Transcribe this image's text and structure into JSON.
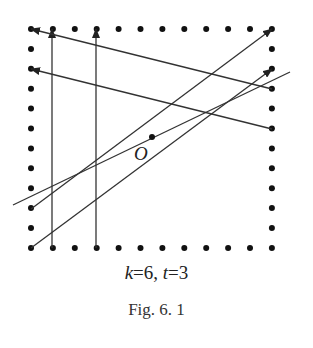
{
  "figure": {
    "caption_params": {
      "k_label": "k",
      "k_value": "=6, ",
      "t_label": "t",
      "t_value": "=3"
    },
    "figure_label": "Fig. 6. 1",
    "point_label": "O"
  },
  "diagram": {
    "grid": {
      "columns": 12,
      "rows": 12,
      "x0": 31,
      "x_step": 21.9,
      "y0": 29,
      "y_step": 19.9,
      "border_only": true
    },
    "center_point": {
      "x": 152,
      "y": 137,
      "label": "O"
    },
    "arrows": [
      {
        "from": [
          52,
          248
        ],
        "to": [
          52,
          29
        ],
        "type": "vertical"
      },
      {
        "from": [
          96,
          248
        ],
        "to": [
          96,
          29
        ],
        "type": "vertical"
      },
      {
        "from": [
          272,
          89
        ],
        "to": [
          31,
          29
        ],
        "type": "leftward"
      },
      {
        "from": [
          272,
          129
        ],
        "to": [
          31,
          69
        ],
        "type": "leftward"
      },
      {
        "from": [
          31,
          209
        ],
        "to": [
          272,
          29
        ],
        "type": "diagonal"
      },
      {
        "from": [
          31,
          248
        ],
        "to": [
          272,
          69
        ],
        "type": "diagonal"
      }
    ],
    "free_line": {
      "from": [
        13,
        205
      ],
      "to": [
        290,
        72
      ],
      "through": "O"
    },
    "colors": {
      "dot": "#111111",
      "line": "#333333"
    }
  }
}
